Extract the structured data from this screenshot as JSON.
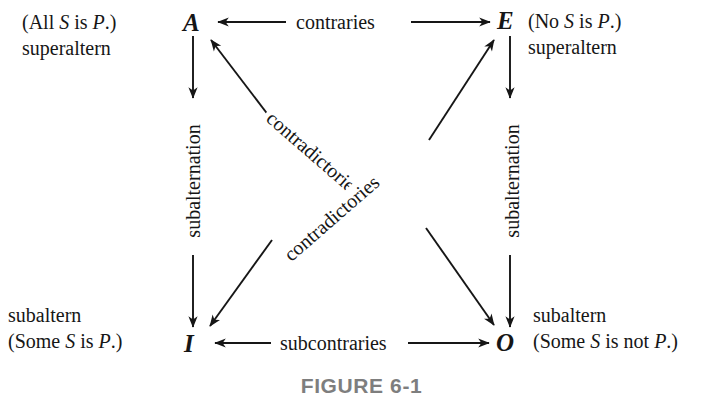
{
  "figure": {
    "caption": "FIGURE 6-1"
  },
  "corners": {
    "a": "A",
    "e": "E",
    "i": "I",
    "o": "O"
  },
  "annotations": {
    "a": {
      "proposition_pre": "(All ",
      "subject": "S",
      "proposition_mid": " is ",
      "predicate": "P",
      "proposition_post": ".)",
      "role": "superaltern"
    },
    "e": {
      "proposition_pre": "(No ",
      "subject": "S",
      "proposition_mid": " is ",
      "predicate": "P",
      "proposition_post": ".)",
      "role": "superaltern"
    },
    "i": {
      "role": "subaltern",
      "proposition_pre": "(Some ",
      "subject": "S",
      "proposition_mid": " is ",
      "predicate": "P",
      "proposition_post": ".)"
    },
    "o": {
      "role": "subaltern",
      "proposition_pre": "(Some ",
      "subject": "S",
      "proposition_mid": " is not ",
      "predicate": "P",
      "proposition_post": ".)"
    }
  },
  "relations": {
    "contraries": "contraries",
    "subcontraries": "subcontraries",
    "subalternation_left": "subalternation",
    "subalternation_right": "subalternation",
    "contradictories_upper": "contradictories",
    "contradictories_lower": "contradictories"
  },
  "colors": {
    "ink": "#161616",
    "background": "#ffffff",
    "caption": "#7e7e7e"
  }
}
